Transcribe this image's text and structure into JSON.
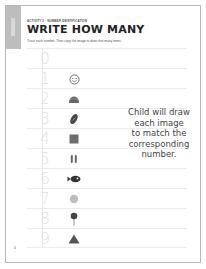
{
  "header": {
    "activity_label": "ACTIVITY 2",
    "activity_separator": " • ",
    "activity_topic": "NUMBER IDENTIFICATION",
    "title": "WRITE HOW MANY",
    "instructions": "Trace each number. Then copy the image to draw that many items."
  },
  "side_tab": {
    "label": "Numbers"
  },
  "rows": [
    {
      "digit": "0",
      "icon": "none"
    },
    {
      "digit": "1",
      "icon": "smiley-face-icon"
    },
    {
      "digit": "2",
      "icon": "taco-icon"
    },
    {
      "digit": "3",
      "icon": "football-icon"
    },
    {
      "digit": "4",
      "icon": "square-icon"
    },
    {
      "digit": "5",
      "icon": "shoe-prints-icon"
    },
    {
      "digit": "6",
      "icon": "fish-icon"
    },
    {
      "digit": "7",
      "icon": "circle-icon"
    },
    {
      "digit": "8",
      "icon": "lollipop-icon"
    },
    {
      "digit": "9",
      "icon": "triangle-icon"
    }
  ],
  "note": {
    "line1": "Child will draw",
    "line2": "each image",
    "line3": "to match the",
    "line4": "corresponding",
    "line5": "number."
  },
  "footer": {
    "page_number": "4"
  },
  "colors": {
    "side_tab": "#bdbdbd",
    "trace_digit": "#e0e0e0",
    "icon_dark": "#555555",
    "border": "#b8b8b8"
  }
}
